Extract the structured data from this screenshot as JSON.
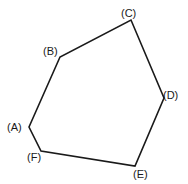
{
  "diagram": {
    "type": "polygon",
    "stroke_color": "#1a1a1a",
    "background": "#ffffff",
    "vertices": [
      {
        "id": "A",
        "label": "(A)",
        "x": 29,
        "y": 127,
        "lx": 7,
        "ly": 131
      },
      {
        "id": "B",
        "label": "(B)",
        "x": 60,
        "y": 57,
        "lx": 43,
        "ly": 55
      },
      {
        "id": "C",
        "label": "(C)",
        "x": 131,
        "y": 20,
        "lx": 121,
        "ly": 17
      },
      {
        "id": "D",
        "label": "(D)",
        "x": 164,
        "y": 98,
        "lx": 163,
        "ly": 99
      },
      {
        "id": "E",
        "label": "(E)",
        "x": 135,
        "y": 166,
        "lx": 133,
        "ly": 178
      },
      {
        "id": "F",
        "label": "(F)",
        "x": 41,
        "y": 151,
        "lx": 27,
        "ly": 161
      }
    ],
    "edges": [
      [
        "A",
        "B"
      ],
      [
        "B",
        "C"
      ],
      [
        "C",
        "D"
      ],
      [
        "D",
        "E"
      ],
      [
        "E",
        "F"
      ],
      [
        "F",
        "A"
      ]
    ]
  }
}
